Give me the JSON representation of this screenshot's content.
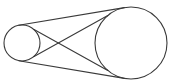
{
  "diagram": {
    "background": "#ffffff",
    "stroke_color": "#3a3a3a",
    "stroke_width": 1.1,
    "circles": [
      {
        "name": "small-circle",
        "cx": 22,
        "cy": 43,
        "r": 18
      },
      {
        "name": "large-circle",
        "cx": 131,
        "cy": 43,
        "r": 36
      }
    ],
    "tangents": [
      {
        "name": "external-tangent-top",
        "x1": 18.7,
        "y1": 25.3,
        "x2": 124.4,
        "y2": 7.6
      },
      {
        "name": "external-tangent-bottom",
        "x1": 18.7,
        "y1": 60.7,
        "x2": 124.4,
        "y2": 78.4
      },
      {
        "name": "internal-tangent-descending",
        "x1": 33.6,
        "y1": 29.3,
        "x2": 107.8,
        "y2": 70.4
      },
      {
        "name": "internal-tangent-ascending",
        "x1": 33.6,
        "y1": 56.7,
        "x2": 107.8,
        "y2": 15.6
      }
    ]
  }
}
